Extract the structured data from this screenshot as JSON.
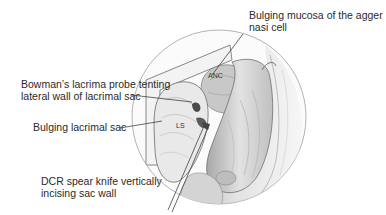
{
  "figure": {
    "labels": {
      "agger_nasi": {
        "line1": "Bulging mucosa of the agger",
        "line2": "nasi cell"
      },
      "bowman_probe": {
        "line1": "Bowman’s lacrima probe tenting",
        "line2": "lateral wall of lacrimal sac"
      },
      "lacrimal_sac": {
        "line1": "Bulging lacrimal sac"
      },
      "spear_knife": {
        "line1": "DCR spear knife vertically",
        "line2": "incising sac wall"
      }
    },
    "inner_labels": {
      "anc": "ANC",
      "ls": "LS"
    },
    "colors": {
      "ink": "#2a2a2a",
      "shade_dark": "#8a8a8a",
      "shade_mid": "#b8b8b8",
      "shade_light": "#dcdcdc",
      "circle": "#9a9a9a"
    }
  }
}
